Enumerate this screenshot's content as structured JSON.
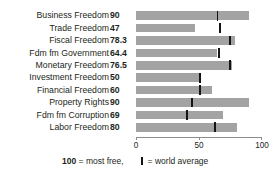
{
  "title": "BRAZIL'S 2008 KEY ECONOMIC FREEDOMS",
  "legend": {
    "most_free_value": "100",
    "most_free_text": "= most free,",
    "world_average_text": "= world average",
    "marker_icon": "world-average-tick-icon"
  },
  "axis": {
    "ticks": [
      "0",
      "50",
      "100"
    ],
    "min": 0,
    "max": 100
  },
  "colors": {
    "bar": "#a3a3a3",
    "marker": "#141414",
    "axis": "#8c8c8c",
    "text": "#231f20",
    "background": "#ffffff"
  },
  "chart_data": {
    "type": "bar",
    "title": "BRAZIL'S 2008 KEY ECONOMIC FREEDOMS",
    "xlabel": "",
    "ylabel": "",
    "xlim": [
      0,
      100
    ],
    "grid": false,
    "orientation": "horizontal",
    "legend_position": "bottom",
    "categories": [
      "Business Freedom",
      "Trade Freedom",
      "Fiscal Freedom",
      "Fdm fm Government",
      "Monetary Freedom",
      "Investment Freedom",
      "Financial Freedom",
      "Property Rights",
      "Fdm fm Corruption",
      "Labor Freedom"
    ],
    "values": [
      90,
      47,
      78.3,
      64.4,
      76.5,
      50,
      60,
      90,
      69,
      80
    ],
    "value_labels": [
      "90",
      "47",
      "78.3",
      "64.4",
      "76.5",
      "50",
      "60",
      "90",
      "69",
      "80"
    ],
    "series": [
      {
        "name": "Brazil score",
        "values": [
          90,
          47,
          78.3,
          64.4,
          76.5,
          50,
          60,
          90,
          69,
          80
        ]
      },
      {
        "name": "world average",
        "values": [
          64,
          66,
          74,
          65,
          74,
          50,
          50,
          44,
          40,
          62
        ]
      }
    ],
    "annotations": [
      "100 = most free",
      "| = world average"
    ]
  }
}
